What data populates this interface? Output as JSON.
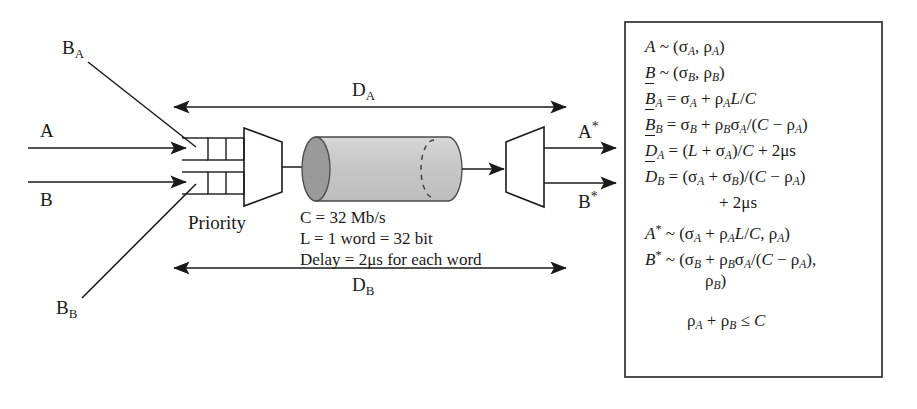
{
  "diagram": {
    "type": "network-traffic-shaping-schematic",
    "inputs": [
      {
        "id": "A",
        "label": "A"
      },
      {
        "id": "B",
        "label": "B"
      }
    ],
    "buffers": [
      {
        "id": "BA",
        "label": "B",
        "sub": "A"
      },
      {
        "id": "BB",
        "label": "B",
        "sub": "B"
      }
    ],
    "mux_label": "Priority",
    "outputs": [
      {
        "id": "Astar",
        "label": "A",
        "star": "*"
      },
      {
        "id": "Bstar",
        "label": "B",
        "star": "*"
      }
    ],
    "spans": [
      {
        "id": "DA",
        "label": "D",
        "sub": "A"
      },
      {
        "id": "DB",
        "label": "D",
        "sub": "B"
      }
    ],
    "channel_caption": [
      "C = 32 Mb/s",
      "L = 1 word = 32 bit",
      "Delay = 2μs for each word"
    ],
    "colors": {
      "ink": "#1a1a1a",
      "cylinder_body": "#c9c9c9",
      "cylinder_cap": "#9a9a9a",
      "box_border": "#3a3a3a"
    }
  },
  "formula_box": {
    "lines": [
      {
        "id": "f1",
        "html": "<i>A</i> ~ (σ<sub><i>A</i></sub>, ρ<sub><i>A</i></sub>)"
      },
      {
        "id": "f2",
        "html": "<i>B</i> ~ (σ<sub><i>B</i></sub>, ρ<sub><i>B</i></sub>)"
      },
      {
        "id": "f3",
        "html": "<span class=\"bar\"><i>B</i></span><sub><i>A</i></sub> = σ<sub><i>A</i></sub> + ρ<sub><i>A</i></sub><i>L</i>/<i>C</i>"
      },
      {
        "id": "f4",
        "html": "<span class=\"bar\"><i>B</i></span><sub><i>B</i></sub> = σ<sub><i>B</i></sub> + ρ<sub><i>B</i></sub>σ<sub><i>A</i></sub>/(<i>C</i> − ρ<sub><i>A</i></sub>)"
      },
      {
        "id": "f5",
        "html": "<span class=\"bar\"><i>D</i></span><sub><i>A</i></sub> = (<i>L</i> + σ<sub><i>A</i></sub>)/<i>C</i> + 2μs"
      },
      {
        "id": "f6",
        "html": "<span class=\"bar\"><i>D</i></span><sub><i>B</i></sub> = (σ<sub><i>A</i></sub> + σ<sub><i>B</i></sub>)/(<i>C</i> − ρ<sub><i>A</i></sub>)"
      },
      {
        "id": "f7",
        "html": "+ 2μs",
        "indent": 74
      },
      {
        "id": "f8",
        "html": "<i>A</i><sup>*</sup> ~ (σ<sub><i>A</i></sub> + ρ<sub><i>A</i></sub><i>L</i>/<i>C</i>, ρ<sub><i>A</i></sub>)"
      },
      {
        "id": "f9",
        "html": "<i>B</i><sup>*</sup> ~ (σ<sub><i>B</i></sub> + ρ<sub><i>B</i></sub>σ<sub><i>A</i></sub>/(<i>C</i> − ρ<sub><i>A</i></sub>),"
      },
      {
        "id": "f10",
        "html": "ρ<sub><i>B</i></sub>)",
        "indent": 60
      },
      {
        "id": "f11",
        "html": "",
        "spacer": true
      },
      {
        "id": "f12",
        "html": "ρ<sub><i>A</i></sub> + ρ<sub><i>B</i></sub> ≤ <i>C</i>",
        "indent": 42
      }
    ]
  }
}
